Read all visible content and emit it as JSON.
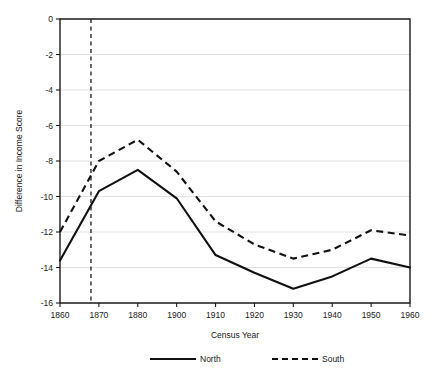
{
  "chart_data": {
    "type": "line",
    "title": "",
    "xlabel": "Census Year",
    "ylabel": "Difference in Income Score",
    "categories": [
      "1860",
      "1870",
      "1880",
      "1900",
      "1910",
      "1920",
      "1930",
      "1940",
      "1950",
      "1960"
    ],
    "x_tick_labels": [
      "1860",
      "1870",
      "1880",
      "1900",
      "1910",
      "1920",
      "1930",
      "1940",
      "1950",
      "1960"
    ],
    "y_tick_labels": [
      "0",
      "-2",
      "-4",
      "-6",
      "-8",
      "-10",
      "-12",
      "-14",
      "-16"
    ],
    "y_ticks": [
      0,
      -2,
      -4,
      -6,
      -8,
      -10,
      -12,
      -14,
      -16
    ],
    "ylim": [
      -16,
      0
    ],
    "grid": "horizontal",
    "legend_position": "bottom",
    "series": [
      {
        "name": "North",
        "style": "solid",
        "color": "#111111",
        "values": [
          -13.6,
          -9.7,
          -8.5,
          -10.1,
          -13.3,
          -14.3,
          -15.2,
          -14.5,
          -13.5,
          -14.0
        ]
      },
      {
        "name": "South",
        "style": "dashed",
        "color": "#111111",
        "values": [
          -12.0,
          -8.0,
          -6.8,
          -8.6,
          -11.4,
          -12.7,
          -13.5,
          -13.0,
          -11.9,
          -12.2
        ]
      }
    ],
    "annotations": [
      {
        "name": "civil-war-marker",
        "type": "vertical-dashed-line",
        "x_value": 1864,
        "x_fraction": 0.0885,
        "label": ""
      }
    ]
  },
  "legend": {
    "entries": [
      {
        "label": "North",
        "style": "solid"
      },
      {
        "label": "South",
        "style": "dashed"
      }
    ]
  },
  "axes": {
    "x_title": "Census Year",
    "y_title": "Difference in Income Score"
  }
}
